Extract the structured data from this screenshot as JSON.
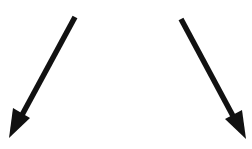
{
  "diagram": {
    "background": "#ffffff",
    "arrows": [
      {
        "name": "left-arrow",
        "direction": "down-left",
        "color": "#111111",
        "tail": [
          75,
          17
        ],
        "tip": [
          9,
          138
        ]
      },
      {
        "name": "right-arrow",
        "direction": "down-right",
        "color": "#111111",
        "tail": [
          181,
          19
        ],
        "tip": [
          246,
          139
        ]
      }
    ]
  }
}
